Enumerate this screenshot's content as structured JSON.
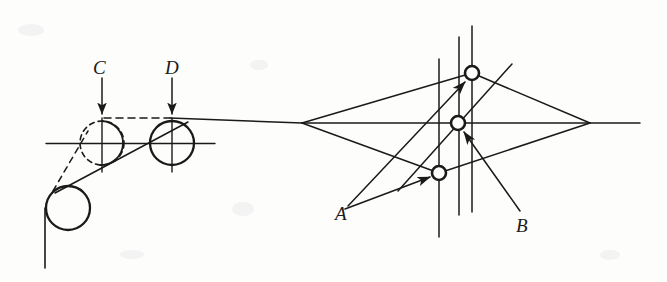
{
  "figure": {
    "background_color": "#fdfdfc",
    "ink_color": "#1a1a1a",
    "labels": [
      {
        "id": "label-c",
        "text": "C",
        "x": 93,
        "y": 58
      },
      {
        "id": "label-d",
        "text": "D",
        "x": 165,
        "y": 58
      },
      {
        "id": "label-a",
        "text": "A",
        "x": 335,
        "y": 204
      },
      {
        "id": "label-b",
        "text": "B",
        "x": 516,
        "y": 216
      }
    ],
    "left_group": {
      "name": "left-roller-assembly",
      "axis_upper_y": 118,
      "axis_center_y": 143,
      "circle_c": {
        "cx": 102,
        "cy": 143,
        "r": 22,
        "style": "dashed"
      },
      "circle_d": {
        "cx": 172,
        "cy": 143,
        "r": 22,
        "style": "solid"
      },
      "circle_lower": {
        "cx": 68,
        "cy": 208,
        "r": 22,
        "style": "solid"
      },
      "arrow_c": {
        "x": 102,
        "y_start": 78,
        "y_end": 116
      },
      "arrow_d": {
        "x": 172,
        "y_start": 78,
        "y_end": 116
      },
      "dashed_connector": {
        "x1": 102,
        "y1": 118,
        "x2": 170,
        "y2": 118
      },
      "vertical_stem_x": 44,
      "vertical_stem_y1": 208,
      "vertical_stem_y2": 268
    },
    "right_group": {
      "name": "right-lens-construction",
      "axis_y": 123,
      "axis_x_start": 150,
      "axis_x_end": 640,
      "apex_left": {
        "x": 302,
        "y": 123
      },
      "apex_right": {
        "x": 590,
        "y": 123
      },
      "vertical_lines": [
        {
          "id": "vline-1",
          "x": 439,
          "y_top": 59,
          "y_bottom": 237
        },
        {
          "id": "vline-2",
          "x": 459,
          "y_top": 37,
          "y_bottom": 215
        },
        {
          "id": "vline-3",
          "x": 472,
          "y_top": 26,
          "y_bottom": 212
        }
      ],
      "nodes": [
        {
          "id": "node-upper",
          "cx": 472,
          "cy": 73,
          "r": 7
        },
        {
          "id": "node-middle",
          "cx": 458,
          "cy": 123,
          "r": 7
        },
        {
          "id": "node-lower",
          "cx": 439,
          "cy": 173,
          "r": 7
        }
      ],
      "leader_arrows": [
        {
          "id": "leader-a-to-lower",
          "x1": 345,
          "y1": 208,
          "x2": 432,
          "y2": 176
        },
        {
          "id": "leader-a-to-upper",
          "x1": 347,
          "y1": 205,
          "x2": 466,
          "y2": 80
        },
        {
          "id": "leader-b-to-middle",
          "x1": 519,
          "y1": 210,
          "x2": 463,
          "y2": 131
        }
      ]
    }
  }
}
